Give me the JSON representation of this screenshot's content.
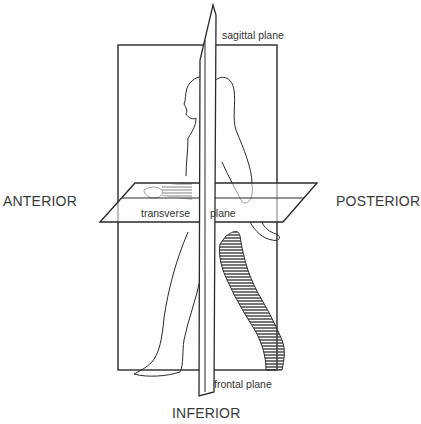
{
  "diagram": {
    "labels": {
      "sagittal": "sagittal plane",
      "anterior": "ANTERIOR",
      "posterior": "POSTERIOR",
      "transverse_left": "transverse",
      "transverse_right": "plane",
      "frontal": "frontal plane",
      "inferior": "INFERIOR"
    },
    "planes": [
      {
        "name": "sagittal plane",
        "shape": "rectangle"
      },
      {
        "name": "frontal plane",
        "shape": "vertical sliver"
      },
      {
        "name": "transverse plane",
        "shape": "parallelogram"
      }
    ],
    "colors": {
      "line": "#2a2a2a",
      "text": "#3a3a3a",
      "hatch": "#3c3c3c",
      "background": "#ffffff"
    }
  }
}
